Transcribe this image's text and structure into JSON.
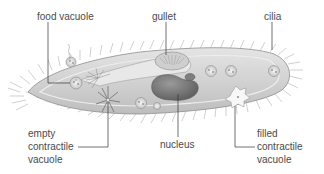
{
  "colors": {
    "background": "#ffffff",
    "label_text": "#4a4a4a",
    "leader_line": "#333333",
    "body_fill": "#d6d6d6",
    "body_outline": "#9a9a9a",
    "nucleus_fill": "#7a7a7a",
    "cilia": "#a8a8a8"
  },
  "labels": {
    "food_vacuole": "food vacuole",
    "gullet": "gullet",
    "cilia": "cilia",
    "empty_contractile_vacuole": [
      "empty",
      "contractile",
      "vacuole"
    ],
    "nucleus": "nucleus",
    "filled_contractile_vacuole": [
      "filled",
      "contractile",
      "vacuole"
    ]
  }
}
